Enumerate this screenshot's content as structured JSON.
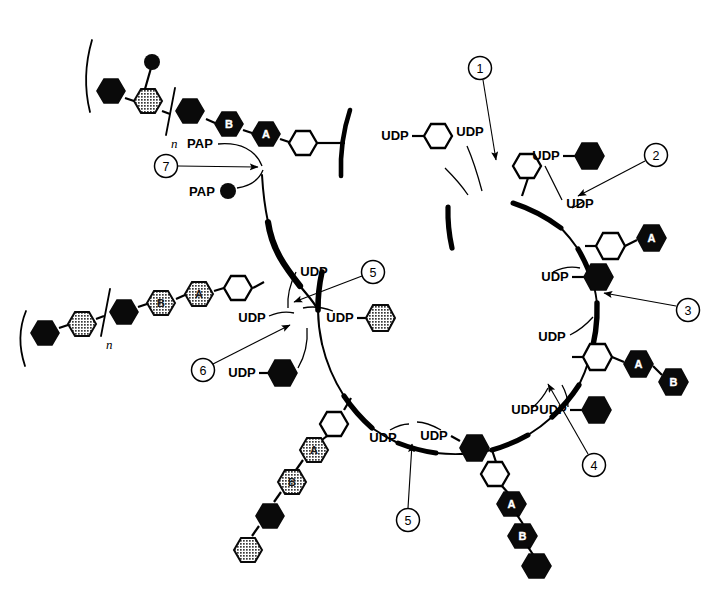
{
  "figure": {
    "membrane_label": "membrane vesicle"
  },
  "labels": {
    "udp": "UDP",
    "pap": "PAP",
    "n_subscript": "n",
    "hex_a": "A",
    "hex_b": "B"
  },
  "steps": [
    {
      "id": "1",
      "number": "1",
      "donor": "UDP",
      "product_note": "UDP"
    },
    {
      "id": "2",
      "number": "2",
      "donor": "UDP",
      "product_note": "UDP"
    },
    {
      "id": "3",
      "number": "3",
      "donor": "UDP",
      "product_note": "UDP"
    },
    {
      "id": "4",
      "number": "4",
      "donor": "UDP",
      "product_note": "UDP"
    },
    {
      "id": "5",
      "number": "5",
      "donor": "UDP",
      "product_note": "UDP"
    },
    {
      "id": "5b",
      "number": "5",
      "donor": "UDP",
      "product_note": "UDP"
    },
    {
      "id": "6",
      "number": "6",
      "donor": "UDP",
      "product_note": "UDP"
    },
    {
      "id": "7",
      "number": "7",
      "donor": "PAP",
      "product_note": "PAP"
    }
  ],
  "donor_labels": [
    {
      "id": "donor-1-left",
      "text": "UDP",
      "x": 395,
      "y": 140
    },
    {
      "id": "release-1",
      "text": "UDP",
      "x": 470,
      "y": 134
    },
    {
      "id": "donor-2",
      "text": "UDP",
      "x": 546,
      "y": 160
    },
    {
      "id": "release-2",
      "text": "UDP",
      "x": 580,
      "y": 204
    },
    {
      "id": "donor-3",
      "text": "UDP",
      "x": 555,
      "y": 281
    },
    {
      "id": "release-3",
      "text": "UDP",
      "x": 552,
      "y": 337
    },
    {
      "id": "donor-4",
      "text": "UDP",
      "x": 553,
      "y": 371
    },
    {
      "id": "release-4",
      "text": "UDP",
      "x": 525,
      "y": 408
    },
    {
      "id": "release-5",
      "text": "UDP",
      "x": 300,
      "y": 272
    },
    {
      "id": "donor-5",
      "text": "UDP",
      "x": 322,
      "y": 318
    },
    {
      "id": "release-6",
      "text": "UDP",
      "x": 236,
      "y": 318
    },
    {
      "id": "donor-6",
      "text": "UDP",
      "x": 225,
      "y": 373
    },
    {
      "id": "release-5b",
      "text": "UDP",
      "x": 383,
      "y": 430
    },
    {
      "id": "donor-5b",
      "text": "UDP",
      "x": 430,
      "y": 428
    },
    {
      "id": "release-7",
      "text": "PAP",
      "x": 200,
      "y": 144
    },
    {
      "id": "donor-7",
      "text": "PAP",
      "x": 198,
      "y": 191
    }
  ],
  "step_circles": [
    {
      "id": "circle-1",
      "number": "1",
      "cx": 480,
      "cy": 68
    },
    {
      "id": "circle-2",
      "number": "2",
      "cx": 656,
      "cy": 155
    },
    {
      "id": "circle-3",
      "number": "3",
      "cx": 688,
      "cy": 310
    },
    {
      "id": "circle-4",
      "number": "4",
      "cx": 594,
      "cy": 465
    },
    {
      "id": "circle-5",
      "number": "5",
      "cx": 373,
      "cy": 272
    },
    {
      "id": "circle-5b",
      "number": "5",
      "cx": 408,
      "cy": 520
    },
    {
      "id": "circle-6",
      "number": "6",
      "cx": 203,
      "cy": 370
    },
    {
      "id": "circle-7",
      "number": "7",
      "cx": 166,
      "cy": 166
    }
  ],
  "chains": {
    "top_left_product": {
      "id": "sulfated-polymer-chain",
      "has_brackets": true,
      "subscript": "n",
      "has_sulfate_dot": true,
      "residues": [
        "black",
        "gray-sulfated",
        "black",
        "black-B",
        "black-A",
        "white"
      ]
    },
    "left_product": {
      "id": "polymer-chain",
      "has_brackets": true,
      "subscript": "n",
      "residues": [
        "black",
        "gray",
        "black",
        "gray-B",
        "gray-A",
        "white"
      ]
    },
    "bottom_left_chain": {
      "id": "membrane-bound-chain-bottom-left",
      "residues": [
        "white",
        "gray-A",
        "gray-B",
        "black",
        "gray"
      ]
    },
    "bottom_center_chain": {
      "id": "membrane-bound-chain-bottom-center",
      "residues": [
        "white",
        "black-A",
        "black-B",
        "black"
      ]
    },
    "right_chain_upper": {
      "id": "membrane-bound-chain-right-upper",
      "residues": [
        "white",
        "black-A"
      ]
    },
    "right_chain_lower": {
      "id": "membrane-bound-chain-right-lower",
      "residues": [
        "white",
        "black-A",
        "black-B"
      ]
    },
    "top_chain": {
      "id": "membrane-bound-chain-top",
      "residues": [
        "white"
      ]
    }
  },
  "free_donors": [
    {
      "id": "free-udp-white-hexagon",
      "type": "white",
      "label": "UDP",
      "cx": 440,
      "cy": 133
    },
    {
      "id": "free-udp-black-hexagon-2",
      "type": "black",
      "label": "UDP",
      "cx": 598,
      "cy": 156
    },
    {
      "id": "free-udp-black-hexagon-3",
      "type": "black",
      "label": "UDP",
      "cx": 610,
      "cy": 280
    },
    {
      "id": "free-udp-black-hexagon-4",
      "type": "black",
      "label": "UDP",
      "cx": 604,
      "cy": 372
    },
    {
      "id": "free-udp-gray-hexagon-5",
      "type": "gray",
      "label": "UDP",
      "cx": 372,
      "cy": 318
    },
    {
      "id": "free-udp-black-hexagon-6",
      "type": "black",
      "label": "UDP",
      "cx": 276,
      "cy": 373
    },
    {
      "id": "free-udp-black-hexagon-5b",
      "type": "black",
      "label": "UDP",
      "cx": 482,
      "cy": 455
    },
    {
      "id": "free-pap-dot-7",
      "type": "dot",
      "label": "PAP",
      "cx": 233,
      "cy": 191
    }
  ]
}
